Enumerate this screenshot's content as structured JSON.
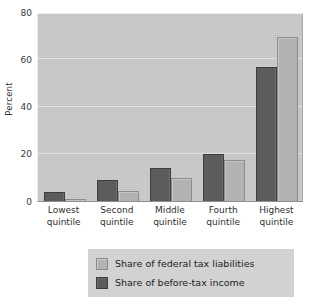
{
  "chart_data": {
    "type": "bar",
    "title": "",
    "subtitle": "",
    "xlabel": "",
    "ylabel": "Percent",
    "ylim": [
      0,
      80
    ],
    "yticks": [
      0,
      20,
      40,
      60,
      80
    ],
    "ytick_labels": [
      "0",
      "20",
      "40",
      "60",
      "80"
    ],
    "grid": true,
    "grid_axis": "y",
    "legend_position": "below-center",
    "categories": [
      "Lowest quintile",
      "Second quintile",
      "Middle quintile",
      "Fourth quintile",
      "Highest quintile"
    ],
    "category_lines": [
      [
        "Lowest",
        "quintile"
      ],
      [
        "Second",
        "quintile"
      ],
      [
        "Middle",
        "quintile"
      ],
      [
        "Fourth",
        "quintile"
      ],
      [
        "Highest",
        "quintile"
      ]
    ],
    "series": [
      {
        "name": "Share of before-tax income",
        "color": "#5c5c5c",
        "values": [
          4.0,
          8.8,
          13.8,
          20.0,
          56.7
        ]
      },
      {
        "name": "Share of federal tax liabilities",
        "color": "#b2b2b2",
        "values": [
          0.8,
          4.2,
          9.8,
          17.5,
          69.4
        ]
      }
    ]
  },
  "axes": {
    "y_title": "Percent"
  },
  "legend": {
    "items": [
      {
        "label": "Share of federal tax liabilities",
        "swatch": "light"
      },
      {
        "label": "Share of before-tax income",
        "swatch": "dark"
      }
    ]
  },
  "colors": {
    "plot_background": "#c9c9c9",
    "gridline": "#e3e3e3",
    "series_dark": "#5c5c5c",
    "series_light": "#b2b2b2",
    "legend_background": "#d2d2d2",
    "page_background": "#ffffff"
  }
}
